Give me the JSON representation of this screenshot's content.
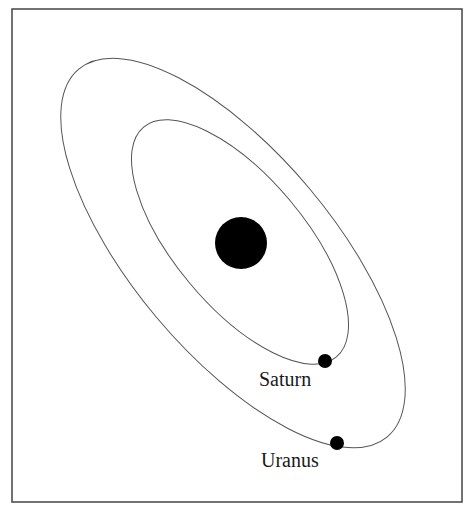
{
  "diagram": {
    "type": "orbital-diagram",
    "frame": {
      "x": 12,
      "y": 9,
      "width": 450,
      "height": 493,
      "stroke": "#444444"
    },
    "sun": {
      "cx": 241,
      "cy": 243,
      "r": 26,
      "fill": "#000000"
    },
    "orbits": [
      {
        "name": "Saturn orbit",
        "cx": 240,
        "cy": 242,
        "rx": 150,
        "ry": 65,
        "rotate": 50
      },
      {
        "name": "Uranus orbit",
        "cx": 233,
        "cy": 253,
        "rx": 240,
        "ry": 100,
        "rotate": 50
      }
    ],
    "planets": [
      {
        "name": "Saturn",
        "cx": 325,
        "cy": 361,
        "r": 7,
        "label": "Saturn",
        "label_x": 259,
        "label_y": 386
      },
      {
        "name": "Uranus",
        "cx": 337,
        "cy": 443,
        "r": 7,
        "label": "Uranus",
        "label_x": 261,
        "label_y": 467
      }
    ]
  }
}
